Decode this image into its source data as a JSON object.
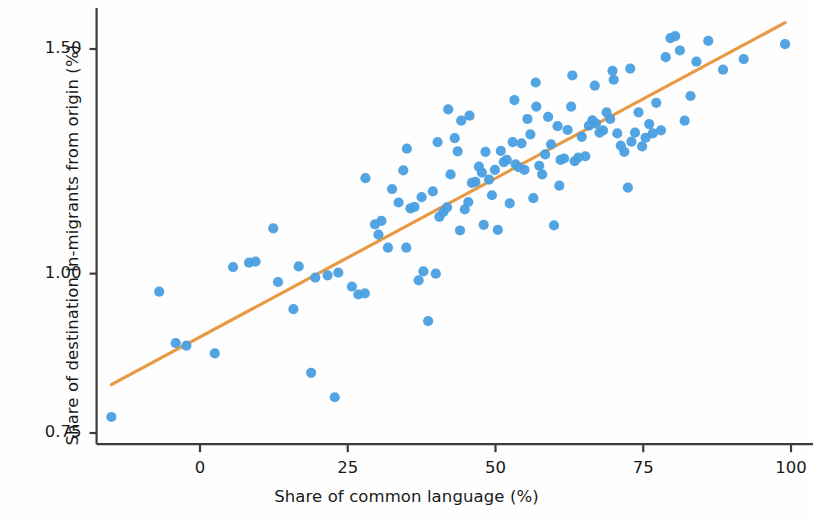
{
  "figure": {
    "background": "#fefefe",
    "point_color": "#4a9fe0",
    "line_color": "#e89a42",
    "axis_color": "#3c3c3c",
    "text_color": "#1a1a1a"
  },
  "chart_data": {
    "type": "scatter",
    "title": "",
    "xlabel": "Share of common language (%)",
    "ylabel": "Share of destination in-migrants from origin (%)",
    "xticks": [
      0,
      25,
      50,
      75,
      100
    ],
    "xticklabels": [
      "0",
      "25",
      "50",
      "75",
      "100"
    ],
    "yticks": [
      0.75,
      1.0,
      1.5
    ],
    "yticklabels": [
      "0.75",
      "1.00",
      "1.50"
    ],
    "yscale": "log",
    "xscale": "linear",
    "xlim": [
      -17.5,
      105
    ],
    "ylim": [
      0.735,
      1.6
    ],
    "grid": false,
    "legend": null,
    "series": [
      {
        "name": "countries",
        "marker": "circle",
        "color": "#4a9fe0",
        "points": [
          [
            -15.0,
            0.772
          ],
          [
            -6.9,
            0.968
          ],
          [
            -4.1,
            0.882
          ],
          [
            -2.3,
            0.878
          ],
          [
            2.5,
            0.866
          ],
          [
            5.6,
            1.012
          ],
          [
            8.3,
            1.02
          ],
          [
            9.4,
            1.022
          ],
          [
            12.4,
            1.085
          ],
          [
            13.2,
            0.985
          ],
          [
            15.8,
            0.938
          ],
          [
            16.7,
            1.013
          ],
          [
            18.8,
            0.836
          ],
          [
            19.5,
            0.993
          ],
          [
            21.6,
            0.997
          ],
          [
            22.8,
            0.8
          ],
          [
            23.4,
            1.002
          ],
          [
            25.7,
            0.977
          ],
          [
            26.8,
            0.963
          ],
          [
            27.9,
            0.965
          ],
          [
            29.6,
            1.093
          ],
          [
            30.7,
            1.1
          ],
          [
            31.8,
            1.048
          ],
          [
            32.5,
            1.165
          ],
          [
            33.6,
            1.137
          ],
          [
            34.4,
            1.205
          ],
          [
            34.9,
            1.048
          ],
          [
            35.6,
            1.125
          ],
          [
            36.3,
            1.128
          ],
          [
            37.0,
            0.988
          ],
          [
            37.8,
            1.004
          ],
          [
            38.6,
            0.918
          ],
          [
            39.4,
            1.16
          ],
          [
            39.9,
            1.0
          ],
          [
            40.5,
            1.108
          ],
          [
            41.2,
            1.118
          ],
          [
            41.8,
            1.127
          ],
          [
            42.4,
            1.196
          ],
          [
            43.1,
            1.277
          ],
          [
            43.6,
            1.247
          ],
          [
            44.2,
            1.318
          ],
          [
            44.8,
            1.123
          ],
          [
            45.4,
            1.138
          ],
          [
            46.0,
            1.178
          ],
          [
            46.6,
            1.18
          ],
          [
            47.2,
            1.213
          ],
          [
            47.7,
            1.2
          ],
          [
            48.3,
            1.246
          ],
          [
            48.9,
            1.185
          ],
          [
            49.4,
            1.152
          ],
          [
            49.9,
            1.206
          ],
          [
            50.4,
            1.082
          ],
          [
            50.9,
            1.248
          ],
          [
            51.4,
            1.223
          ],
          [
            51.9,
            1.228
          ],
          [
            52.4,
            1.135
          ],
          [
            52.9,
            1.268
          ],
          [
            53.4,
            1.218
          ],
          [
            53.9,
            1.212
          ],
          [
            54.4,
            1.265
          ],
          [
            54.9,
            1.206
          ],
          [
            55.4,
            1.322
          ],
          [
            55.9,
            1.286
          ],
          [
            56.4,
            1.146
          ],
          [
            56.9,
            1.352
          ],
          [
            57.4,
            1.215
          ],
          [
            57.9,
            1.196
          ],
          [
            58.4,
            1.24
          ],
          [
            58.9,
            1.327
          ],
          [
            59.4,
            1.263
          ],
          [
            59.9,
            1.091
          ],
          [
            60.5,
            1.305
          ],
          [
            61.0,
            1.228
          ],
          [
            61.6,
            1.231
          ],
          [
            62.2,
            1.296
          ],
          [
            62.8,
            1.352
          ],
          [
            63.4,
            1.225
          ],
          [
            64.0,
            1.233
          ],
          [
            64.6,
            1.28
          ],
          [
            65.2,
            1.236
          ],
          [
            65.8,
            1.306
          ],
          [
            66.4,
            1.319
          ],
          [
            67.0,
            1.311
          ],
          [
            67.6,
            1.29
          ],
          [
            68.2,
            1.295
          ],
          [
            68.8,
            1.338
          ],
          [
            69.4,
            1.322
          ],
          [
            70.0,
            1.419
          ],
          [
            70.6,
            1.288
          ],
          [
            71.2,
            1.26
          ],
          [
            71.8,
            1.246
          ],
          [
            72.4,
            1.168
          ],
          [
            73.0,
            1.269
          ],
          [
            73.6,
            1.29
          ],
          [
            74.2,
            1.338
          ],
          [
            74.8,
            1.258
          ],
          [
            75.4,
            1.278
          ],
          [
            76.0,
            1.31
          ],
          [
            76.6,
            1.288
          ],
          [
            77.2,
            1.361
          ],
          [
            78.0,
            1.295
          ],
          [
            78.8,
            1.478
          ],
          [
            79.6,
            1.53
          ],
          [
            80.4,
            1.535
          ],
          [
            81.2,
            1.496
          ],
          [
            82.0,
            1.318
          ],
          [
            83.0,
            1.378
          ],
          [
            84.0,
            1.466
          ],
          [
            86.0,
            1.522
          ],
          [
            88.5,
            1.445
          ],
          [
            92.0,
            1.473
          ],
          [
            99.0,
            1.513
          ],
          [
            42.0,
            1.345
          ],
          [
            45.6,
            1.33
          ],
          [
            48.0,
            1.092
          ],
          [
            53.2,
            1.368
          ],
          [
            56.8,
            1.412
          ],
          [
            60.8,
            1.172
          ],
          [
            63.0,
            1.43
          ],
          [
            66.8,
            1.404
          ],
          [
            69.8,
            1.442
          ],
          [
            72.8,
            1.448
          ],
          [
            40.2,
            1.268
          ],
          [
            44.0,
            1.081
          ],
          [
            37.5,
            1.148
          ],
          [
            30.2,
            1.073
          ],
          [
            28.0,
            1.188
          ],
          [
            35.0,
            1.253
          ]
        ]
      }
    ],
    "trendline": {
      "type": "linear-fit",
      "color": "#e89a42",
      "x_start": -15.0,
      "y_start": 0.8185,
      "x_end": 99.0,
      "y_end": 1.573
    }
  },
  "axes": {
    "y_ticks": [
      {
        "label": "1.50",
        "value": 1.5
      },
      {
        "label": "1.00",
        "value": 1.0
      },
      {
        "label": "0.75",
        "value": 0.75
      }
    ],
    "x_ticks": [
      {
        "label": "0",
        "value": 0
      },
      {
        "label": "25",
        "value": 25
      },
      {
        "label": "50",
        "value": 50
      },
      {
        "label": "75",
        "value": 75
      },
      {
        "label": "100",
        "value": 100
      }
    ]
  }
}
